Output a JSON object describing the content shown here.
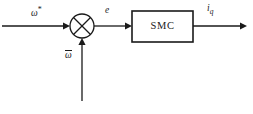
{
  "diagram": {
    "background_color": "#ffffff",
    "stroke_color": "#1a1a1a",
    "blocks": [
      {
        "id": "smc",
        "label": "SMC",
        "shape": "rectangle",
        "x": 132,
        "y": 11,
        "width": 61,
        "height": 31
      }
    ],
    "junctions": [
      {
        "id": "summing-junction",
        "shape": "circle-with-cross",
        "cx": 82,
        "cy": 26,
        "r": 12
      }
    ],
    "signals": {
      "reference": {
        "name": "omega-reference",
        "symbol": "ω",
        "superscript": "*",
        "description": "reference speed input"
      },
      "error": {
        "name": "error",
        "symbol": "e",
        "description": "speed error into controller"
      },
      "feedback": {
        "name": "omega-feedback",
        "symbol": "ω",
        "overbar": true,
        "description": "estimated speed feedback"
      },
      "output": {
        "name": "iq-current",
        "symbol": "i",
        "subscript": "q",
        "description": "q-axis current command output"
      }
    },
    "wires": [
      {
        "id": "wire-input",
        "from": "left-edge",
        "to": "summing-junction",
        "orientation": "horizontal",
        "arrow": true
      },
      {
        "id": "wire-error",
        "from": "summing-junction",
        "to": "smc",
        "orientation": "horizontal",
        "arrow": true
      },
      {
        "id": "wire-output",
        "from": "smc",
        "to": "right-edge",
        "orientation": "horizontal",
        "arrow": true
      },
      {
        "id": "wire-feedback",
        "from": "bottom-edge",
        "to": "summing-junction",
        "orientation": "vertical",
        "arrow": true
      }
    ]
  }
}
